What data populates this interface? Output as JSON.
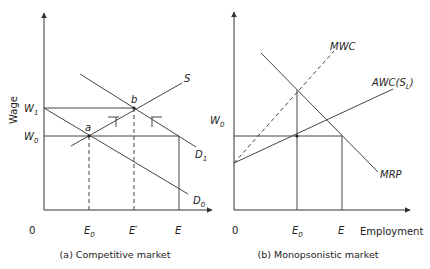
{
  "panel_a": {
    "caption": "(a) Competitive market",
    "y_axis_label": "Wage",
    "origin_label": "0",
    "w1_label": "W",
    "w1_sub": "1",
    "w0_label": "W",
    "w0_sub": "0",
    "point_a": "a",
    "point_b": "b",
    "s_label": "S",
    "d1_label": "D",
    "d1_sub": "1",
    "d0_label": "D",
    "d0_sub": "0",
    "e0_label": "E",
    "e0_sub": "0",
    "eprime_label": "E′",
    "e_label": "E"
  },
  "panel_b": {
    "caption": "(b) Monopsonistic market",
    "x_axis_label": "Employment",
    "origin_label": "0",
    "w0_label": "W",
    "w0_sub": "0",
    "mwc_label": "MWC",
    "awc_label": "AWC(S",
    "awc_sub": "L",
    "awc_close": ")",
    "mrp_label": "MRP",
    "e0_label": "E",
    "e0_sub": "0",
    "e_label": "E"
  }
}
